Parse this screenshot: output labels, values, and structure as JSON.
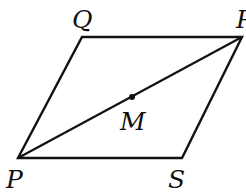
{
  "figure": {
    "type": "parallelogram",
    "stroke_color": "#111111",
    "vertices": {
      "P": {
        "label": "P",
        "x": 18,
        "y": 158
      },
      "Q": {
        "label": "Q",
        "x": 82,
        "y": 37
      },
      "R": {
        "label": "R",
        "x": 242,
        "y": 37
      },
      "S": {
        "label": "S",
        "x": 182,
        "y": 158
      }
    },
    "midpoint": {
      "label": "M",
      "x": 132,
      "y": 97
    },
    "diagonal": "PR"
  }
}
